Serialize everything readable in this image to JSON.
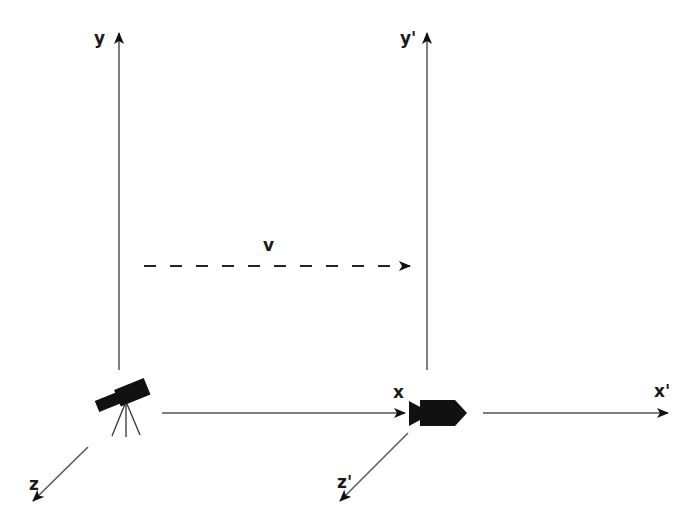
{
  "diagram": {
    "colors": {
      "line": "#555555",
      "ink": "#111111",
      "background": "#ffffff"
    },
    "frame_S": {
      "labels": {
        "x": "x",
        "y": "y",
        "z": "z"
      },
      "observer_icon": "telescope-icon"
    },
    "frame_S_prime": {
      "labels": {
        "x": "x'",
        "y": "y'",
        "z": "z'"
      },
      "observer_icon": "rocket-icon"
    },
    "velocity": {
      "label": "v",
      "style": "dashed",
      "direction": "+x"
    }
  }
}
